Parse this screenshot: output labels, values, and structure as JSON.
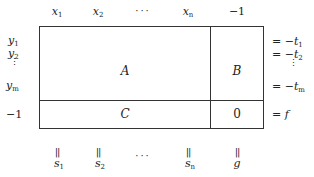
{
  "diagram": {
    "type": "tableau",
    "top_labels": [
      {
        "base": "x",
        "sub": "1"
      },
      {
        "base": "x",
        "sub": "2"
      },
      {
        "ellipsis": "···"
      },
      {
        "base": "x",
        "sub": "n"
      },
      {
        "text": "−1"
      }
    ],
    "left_labels": [
      {
        "base": "y",
        "sub": "1"
      },
      {
        "base": "y",
        "sub": "2"
      },
      {
        "vdots": "⋮"
      },
      {
        "base": "y",
        "sub": "m"
      },
      {
        "text": "−1"
      }
    ],
    "right_labels": [
      {
        "prefix": "= −",
        "base": "t",
        "sub": "1"
      },
      {
        "prefix": "= −",
        "base": "t",
        "sub": "2"
      },
      {
        "vdots": "⋮"
      },
      {
        "prefix": "= −",
        "base": "t",
        "sub": "m"
      },
      {
        "prefix": "= ",
        "base": "f"
      }
    ],
    "bottom_labels": [
      {
        "eq": "||",
        "base": "s",
        "sub": "1"
      },
      {
        "eq": "||",
        "base": "s",
        "sub": "2"
      },
      {
        "ellipsis": "···"
      },
      {
        "eq": "||",
        "base": "s",
        "sub": "n"
      },
      {
        "eq": "||",
        "base": "g"
      }
    ],
    "cells": {
      "A": "A",
      "B": "B",
      "C": "C",
      "D": "0"
    }
  }
}
